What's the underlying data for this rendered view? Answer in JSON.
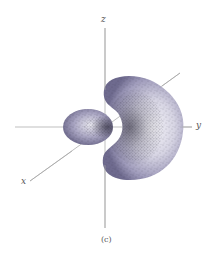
{
  "figure": {
    "caption": "(c)",
    "axes": {
      "x_label": "x",
      "y_label": "y",
      "z_label": "z"
    },
    "lobes": [
      {
        "name": "small lobe",
        "shape": "ellipsoid",
        "side": "negative y"
      },
      {
        "name": "large lobe",
        "shape": "crescent / torus-like",
        "side": "positive y"
      }
    ],
    "colors": {
      "lobe_dark": "#6e6a8e",
      "lobe_mid": "#a6a2bf",
      "lobe_light": "#ecebf2",
      "axis": "#9a9a9a",
      "dots": "#2a2838"
    }
  }
}
